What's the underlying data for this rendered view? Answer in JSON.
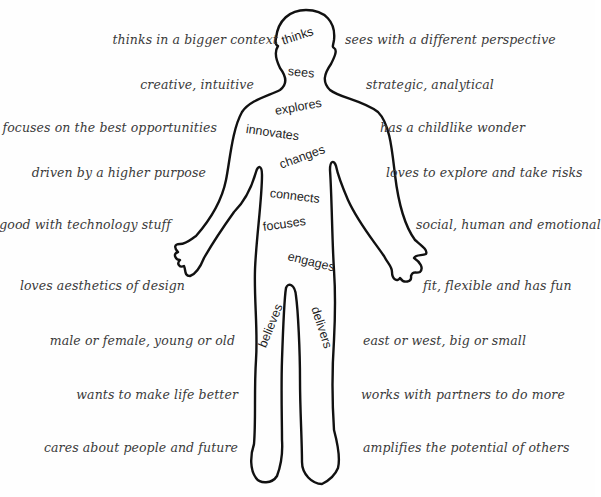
{
  "figure": {
    "outline_color": "#111111",
    "text_color": "#3a3a3a",
    "background": "#fefefe"
  },
  "body_words": [
    {
      "id": "thinks",
      "text": "thinks"
    },
    {
      "id": "sees",
      "text": "sees"
    },
    {
      "id": "explores",
      "text": "explores"
    },
    {
      "id": "innovates",
      "text": "innovates"
    },
    {
      "id": "changes",
      "text": "changes"
    },
    {
      "id": "connects",
      "text": "connects"
    },
    {
      "id": "focuses",
      "text": "focuses"
    },
    {
      "id": "engages",
      "text": "engages"
    },
    {
      "id": "believes",
      "text": "believes"
    },
    {
      "id": "delivers",
      "text": "delivers"
    }
  ],
  "left_traits": [
    "thinks in a bigger context",
    "creative, intuitive",
    "focuses on the best opportunities",
    "driven by a higher purpose",
    "good with technology stuff",
    "loves aesthetics of design",
    "male or female, young or old",
    "wants to make life better",
    "cares about people and future"
  ],
  "right_traits": [
    "sees with a different perspective",
    "strategic, analytical",
    "has a childlike wonder",
    "loves to explore and take risks",
    "social, human and emotional",
    "fit, flexible and has fun",
    "east or west, big or small",
    "works with partners to do more",
    "amplifies the potential of  others"
  ]
}
